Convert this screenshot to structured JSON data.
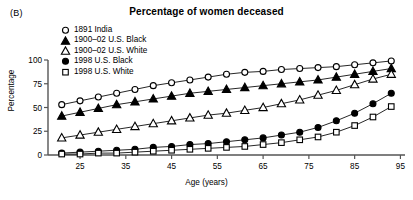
{
  "panel": {
    "label": "(B)"
  },
  "title": "Percentage of women deceased",
  "axes": {
    "x_label": "Age (years)",
    "y_label": "Percentage",
    "x_ticks": [
      "25",
      "35",
      "45",
      "55",
      "65",
      "75",
      "85",
      "95"
    ],
    "y_ticks": [
      "0",
      "25",
      "50",
      "75",
      "100"
    ]
  },
  "legend": {
    "items": [
      {
        "label": "1891 India",
        "marker": "open-circle-icon",
        "color": "#000000"
      },
      {
        "label": "1900–02 U.S. Black",
        "marker": "filled-triangle-icon",
        "color": "#000000"
      },
      {
        "label": "1900–02 U.S. White",
        "marker": "open-triangle-icon",
        "color": "#000000"
      },
      {
        "label": "1998 U.S. Black",
        "marker": "filled-circle-icon",
        "color": "#000000"
      },
      {
        "label": "1998 U.S. White",
        "marker": "open-square-icon",
        "color": "#000000"
      }
    ]
  },
  "chart_data": {
    "type": "line",
    "title": "Percentage of women deceased",
    "xlabel": "Age (years)",
    "ylabel": "Percentage",
    "xlim": [
      18,
      96
    ],
    "ylim": [
      0,
      100
    ],
    "grid": false,
    "legend_position": "upper-left-inside",
    "x_ticks": [
      25,
      35,
      45,
      55,
      65,
      75,
      85,
      95
    ],
    "y_ticks": [
      0,
      25,
      50,
      75,
      100
    ],
    "series": [
      {
        "name": "1891 India",
        "marker": "open-circle",
        "color": "#000000",
        "x": [
          21,
          25,
          29,
          33,
          37,
          41,
          45,
          49,
          53,
          57,
          61,
          65,
          69,
          73,
          77,
          81,
          85,
          89,
          93
        ],
        "y": [
          53,
          57,
          61,
          65,
          69,
          73,
          76,
          79,
          82,
          85,
          87,
          88,
          90,
          91,
          92,
          93,
          95,
          97,
          99
        ]
      },
      {
        "name": "1900–02 U.S. Black",
        "marker": "filled-triangle",
        "color": "#000000",
        "x": [
          21,
          25,
          29,
          33,
          37,
          41,
          45,
          49,
          53,
          57,
          61,
          65,
          69,
          73,
          77,
          81,
          85,
          89,
          93
        ],
        "y": [
          41,
          45,
          49,
          53,
          56,
          59,
          62,
          65,
          67,
          69,
          71,
          73,
          75,
          77,
          79,
          82,
          85,
          88,
          91
        ]
      },
      {
        "name": "1900–02 U.S. White",
        "marker": "open-triangle",
        "color": "#000000",
        "x": [
          21,
          25,
          29,
          33,
          37,
          41,
          45,
          49,
          53,
          57,
          61,
          65,
          69,
          73,
          77,
          81,
          85,
          89,
          93
        ],
        "y": [
          18,
          21,
          24,
          27,
          30,
          33,
          36,
          39,
          42,
          44,
          47,
          50,
          54,
          58,
          63,
          68,
          74,
          80,
          85
        ]
      },
      {
        "name": "1998 U.S. Black",
        "marker": "filled-circle",
        "color": "#000000",
        "x": [
          21,
          25,
          29,
          33,
          37,
          41,
          45,
          49,
          53,
          57,
          61,
          65,
          69,
          73,
          77,
          81,
          85,
          89,
          93
        ],
        "y": [
          2,
          3,
          4,
          5,
          6,
          8,
          9,
          11,
          12,
          14,
          16,
          18,
          21,
          24,
          29,
          36,
          44,
          54,
          65
        ]
      },
      {
        "name": "1998 U.S. White",
        "marker": "open-square",
        "color": "#000000",
        "x": [
          21,
          25,
          29,
          33,
          37,
          41,
          45,
          49,
          53,
          57,
          61,
          65,
          69,
          73,
          77,
          81,
          85,
          89,
          93
        ],
        "y": [
          1,
          1,
          2,
          2,
          3,
          4,
          5,
          6,
          7,
          8,
          9,
          11,
          13,
          16,
          19,
          24,
          31,
          40,
          51
        ]
      }
    ]
  }
}
